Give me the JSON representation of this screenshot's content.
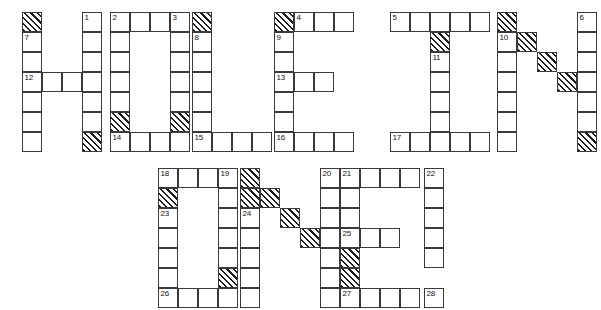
{
  "puzzle": {
    "title": "HOLE IN ONE!",
    "cell_size": 20,
    "grid_line_color": "#3a3a3a",
    "blocked_fill": "hatched-diagonal",
    "letters": [
      {
        "name": "H",
        "origin": [
          22,
          12
        ],
        "cells": [
          {
            "col": 0,
            "row": 0,
            "blocked": true
          },
          {
            "col": 0,
            "row": 1,
            "blocked": false,
            "number": "7"
          },
          {
            "col": 0,
            "row": 2,
            "blocked": false
          },
          {
            "col": 0,
            "row": 3,
            "blocked": false,
            "number": "12"
          },
          {
            "col": 0,
            "row": 4,
            "blocked": false
          },
          {
            "col": 0,
            "row": 5,
            "blocked": false
          },
          {
            "col": 0,
            "row": 6,
            "blocked": false
          },
          {
            "col": 1,
            "row": 3,
            "blocked": false
          },
          {
            "col": 2,
            "row": 3,
            "blocked": false
          },
          {
            "col": 3,
            "row": 0,
            "blocked": false,
            "number": "1"
          },
          {
            "col": 3,
            "row": 1,
            "blocked": false
          },
          {
            "col": 3,
            "row": 2,
            "blocked": false
          },
          {
            "col": 3,
            "row": 3,
            "blocked": false
          },
          {
            "col": 3,
            "row": 4,
            "blocked": false
          },
          {
            "col": 3,
            "row": 5,
            "blocked": false
          },
          {
            "col": 3,
            "row": 6,
            "blocked": true
          }
        ]
      },
      {
        "name": "O",
        "origin": [
          110,
          12
        ],
        "cells": [
          {
            "col": 0,
            "row": 0,
            "blocked": false,
            "number": "2"
          },
          {
            "col": 1,
            "row": 0,
            "blocked": false
          },
          {
            "col": 2,
            "row": 0,
            "blocked": false
          },
          {
            "col": 3,
            "row": 0,
            "blocked": false,
            "number": "3"
          },
          {
            "col": 0,
            "row": 1,
            "blocked": false
          },
          {
            "col": 3,
            "row": 1,
            "blocked": false
          },
          {
            "col": 0,
            "row": 2,
            "blocked": false
          },
          {
            "col": 3,
            "row": 2,
            "blocked": false
          },
          {
            "col": 0,
            "row": 3,
            "blocked": false
          },
          {
            "col": 3,
            "row": 3,
            "blocked": false
          },
          {
            "col": 0,
            "row": 4,
            "blocked": false
          },
          {
            "col": 3,
            "row": 4,
            "blocked": false
          },
          {
            "col": 0,
            "row": 5,
            "blocked": true
          },
          {
            "col": 3,
            "row": 5,
            "blocked": true
          },
          {
            "col": 0,
            "row": 6,
            "blocked": false,
            "number": "14"
          },
          {
            "col": 1,
            "row": 6,
            "blocked": false
          },
          {
            "col": 2,
            "row": 6,
            "blocked": false
          },
          {
            "col": 3,
            "row": 6,
            "blocked": false
          }
        ]
      },
      {
        "name": "L",
        "origin": [
          192,
          12
        ],
        "cells": [
          {
            "col": 0,
            "row": 0,
            "blocked": true
          },
          {
            "col": 0,
            "row": 1,
            "blocked": false,
            "number": "8"
          },
          {
            "col": 0,
            "row": 2,
            "blocked": false
          },
          {
            "col": 0,
            "row": 3,
            "blocked": false
          },
          {
            "col": 0,
            "row": 4,
            "blocked": false
          },
          {
            "col": 0,
            "row": 5,
            "blocked": false
          },
          {
            "col": 0,
            "row": 6,
            "blocked": false,
            "number": "15"
          },
          {
            "col": 1,
            "row": 6,
            "blocked": false
          },
          {
            "col": 2,
            "row": 6,
            "blocked": false
          },
          {
            "col": 3,
            "row": 6,
            "blocked": false
          }
        ]
      },
      {
        "name": "E",
        "origin": [
          274,
          12
        ],
        "cells": [
          {
            "col": 0,
            "row": 0,
            "blocked": true
          },
          {
            "col": 1,
            "row": 0,
            "blocked": false,
            "number": "4"
          },
          {
            "col": 2,
            "row": 0,
            "blocked": false
          },
          {
            "col": 3,
            "row": 0,
            "blocked": false
          },
          {
            "col": 0,
            "row": 1,
            "blocked": false,
            "number": "9"
          },
          {
            "col": 0,
            "row": 2,
            "blocked": false
          },
          {
            "col": 0,
            "row": 3,
            "blocked": false,
            "number": "13"
          },
          {
            "col": 1,
            "row": 3,
            "blocked": false
          },
          {
            "col": 2,
            "row": 3,
            "blocked": false
          },
          {
            "col": 0,
            "row": 4,
            "blocked": false
          },
          {
            "col": 0,
            "row": 5,
            "blocked": false
          },
          {
            "col": 0,
            "row": 6,
            "blocked": false,
            "number": "16"
          },
          {
            "col": 1,
            "row": 6,
            "blocked": false
          },
          {
            "col": 2,
            "row": 6,
            "blocked": false
          },
          {
            "col": 3,
            "row": 6,
            "blocked": false
          }
        ]
      },
      {
        "name": "I",
        "origin": [
          390,
          12
        ],
        "cells": [
          {
            "col": 0,
            "row": 0,
            "blocked": false,
            "number": "5"
          },
          {
            "col": 1,
            "row": 0,
            "blocked": false
          },
          {
            "col": 2,
            "row": 0,
            "blocked": false
          },
          {
            "col": 3,
            "row": 0,
            "blocked": false
          },
          {
            "col": 4,
            "row": 0,
            "blocked": false
          },
          {
            "col": 2,
            "row": 1,
            "blocked": true
          },
          {
            "col": 2,
            "row": 2,
            "blocked": false,
            "number": "11"
          },
          {
            "col": 2,
            "row": 3,
            "blocked": false
          },
          {
            "col": 2,
            "row": 4,
            "blocked": false
          },
          {
            "col": 2,
            "row": 5,
            "blocked": false
          },
          {
            "col": 0,
            "row": 6,
            "blocked": false,
            "number": "17"
          },
          {
            "col": 1,
            "row": 6,
            "blocked": false
          },
          {
            "col": 2,
            "row": 6,
            "blocked": false
          },
          {
            "col": 3,
            "row": 6,
            "blocked": false
          },
          {
            "col": 4,
            "row": 6,
            "blocked": false
          }
        ]
      },
      {
        "name": "N",
        "origin": [
          497,
          12
        ],
        "cells": [
          {
            "col": 0,
            "row": 0,
            "blocked": true
          },
          {
            "col": 0,
            "row": 1,
            "blocked": false,
            "number": "10"
          },
          {
            "col": 0,
            "row": 2,
            "blocked": false
          },
          {
            "col": 0,
            "row": 3,
            "blocked": false
          },
          {
            "col": 0,
            "row": 4,
            "blocked": false
          },
          {
            "col": 0,
            "row": 5,
            "blocked": false
          },
          {
            "col": 0,
            "row": 6,
            "blocked": false
          },
          {
            "col": 1,
            "row": 1,
            "blocked": true
          },
          {
            "col": 2,
            "row": 2,
            "blocked": true
          },
          {
            "col": 3,
            "row": 3,
            "blocked": true
          },
          {
            "col": 4,
            "row": 0,
            "blocked": false,
            "number": "6"
          },
          {
            "col": 4,
            "row": 1,
            "blocked": false
          },
          {
            "col": 4,
            "row": 2,
            "blocked": false
          },
          {
            "col": 4,
            "row": 3,
            "blocked": false
          },
          {
            "col": 4,
            "row": 4,
            "blocked": false
          },
          {
            "col": 4,
            "row": 5,
            "blocked": false
          },
          {
            "col": 4,
            "row": 6,
            "blocked": true
          }
        ]
      },
      {
        "name": "O2",
        "origin": [
          158,
          168
        ],
        "cells": [
          {
            "col": 0,
            "row": 0,
            "blocked": false,
            "number": "18"
          },
          {
            "col": 1,
            "row": 0,
            "blocked": false
          },
          {
            "col": 2,
            "row": 0,
            "blocked": false
          },
          {
            "col": 3,
            "row": 0,
            "blocked": false,
            "number": "19"
          },
          {
            "col": 0,
            "row": 1,
            "blocked": true
          },
          {
            "col": 3,
            "row": 1,
            "blocked": false
          },
          {
            "col": 0,
            "row": 2,
            "blocked": false,
            "number": "23"
          },
          {
            "col": 3,
            "row": 2,
            "blocked": false
          },
          {
            "col": 0,
            "row": 3,
            "blocked": false
          },
          {
            "col": 3,
            "row": 3,
            "blocked": false
          },
          {
            "col": 0,
            "row": 4,
            "blocked": false
          },
          {
            "col": 3,
            "row": 4,
            "blocked": false
          },
          {
            "col": 0,
            "row": 5,
            "blocked": false
          },
          {
            "col": 3,
            "row": 5,
            "blocked": true
          },
          {
            "col": 0,
            "row": 6,
            "blocked": false,
            "number": "26"
          },
          {
            "col": 1,
            "row": 6,
            "blocked": false
          },
          {
            "col": 2,
            "row": 6,
            "blocked": false
          },
          {
            "col": 3,
            "row": 6,
            "blocked": false
          }
        ]
      },
      {
        "name": "N2",
        "origin": [
          240,
          168
        ],
        "cells": [
          {
            "col": 0,
            "row": 0,
            "blocked": true
          },
          {
            "col": 0,
            "row": 1,
            "blocked": true
          },
          {
            "col": 0,
            "row": 2,
            "blocked": false,
            "number": "24"
          },
          {
            "col": 0,
            "row": 3,
            "blocked": false
          },
          {
            "col": 0,
            "row": 4,
            "blocked": false
          },
          {
            "col": 0,
            "row": 5,
            "blocked": false
          },
          {
            "col": 0,
            "row": 6,
            "blocked": false
          },
          {
            "col": 1,
            "row": 1,
            "blocked": true
          },
          {
            "col": 2,
            "row": 2,
            "blocked": true
          },
          {
            "col": 3,
            "row": 3,
            "blocked": true
          },
          {
            "col": 4,
            "row": 0,
            "blocked": false,
            "number": "20"
          },
          {
            "col": 4,
            "row": 1,
            "blocked": false
          },
          {
            "col": 4,
            "row": 2,
            "blocked": false
          },
          {
            "col": 4,
            "row": 3,
            "blocked": false
          },
          {
            "col": 4,
            "row": 4,
            "blocked": false
          },
          {
            "col": 4,
            "row": 5,
            "blocked": false
          },
          {
            "col": 4,
            "row": 6,
            "blocked": false
          }
        ]
      },
      {
        "name": "E2",
        "origin": [
          340,
          168
        ],
        "cells": [
          {
            "col": 0,
            "row": 0,
            "blocked": false,
            "number": "21"
          },
          {
            "col": 1,
            "row": 0,
            "blocked": false
          },
          {
            "col": 2,
            "row": 0,
            "blocked": false
          },
          {
            "col": 3,
            "row": 0,
            "blocked": false
          },
          {
            "col": 0,
            "row": 1,
            "blocked": false
          },
          {
            "col": 0,
            "row": 2,
            "blocked": false
          },
          {
            "col": 0,
            "row": 3,
            "blocked": false,
            "number": "25"
          },
          {
            "col": 1,
            "row": 3,
            "blocked": false
          },
          {
            "col": 2,
            "row": 3,
            "blocked": false
          },
          {
            "col": 0,
            "row": 4,
            "blocked": true
          },
          {
            "col": 0,
            "row": 5,
            "blocked": true
          },
          {
            "col": 0,
            "row": 6,
            "blocked": false,
            "number": "27"
          },
          {
            "col": 1,
            "row": 6,
            "blocked": false
          },
          {
            "col": 2,
            "row": 6,
            "blocked": false
          },
          {
            "col": 3,
            "row": 6,
            "blocked": false
          }
        ]
      },
      {
        "name": "EXCLAMATION",
        "origin": [
          424,
          168
        ],
        "cells": [
          {
            "col": 0,
            "row": 0,
            "blocked": false,
            "number": "22"
          },
          {
            "col": 0,
            "row": 1,
            "blocked": false
          },
          {
            "col": 0,
            "row": 2,
            "blocked": false
          },
          {
            "col": 0,
            "row": 3,
            "blocked": false
          },
          {
            "col": 0,
            "row": 4,
            "blocked": false
          },
          {
            "col": 0,
            "row": 6,
            "blocked": false,
            "number": "28"
          }
        ]
      }
    ]
  }
}
